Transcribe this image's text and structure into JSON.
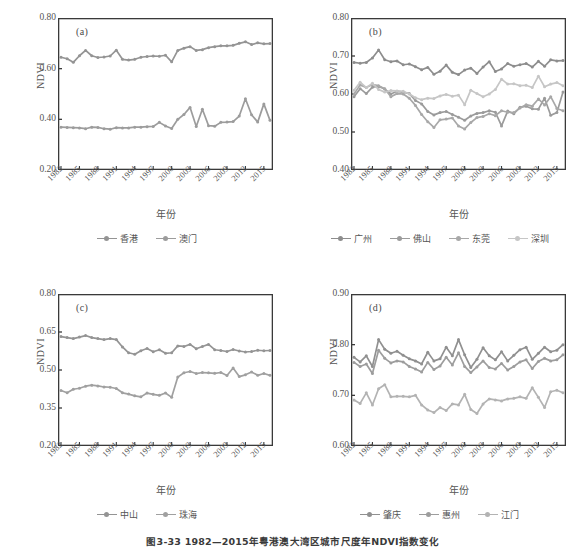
{
  "figure": {
    "caption": "图3-33  1982—2015年粤港澳大湾区城市尺度年NDVI指数变化",
    "axis_label_y": "NDVI",
    "axis_label_x": "年份"
  },
  "colors": {
    "dark_gray": "#8d8d8d",
    "mid_gray": "#a0a0a0",
    "light_gray": "#b9b9b9",
    "pale_gray": "#cfcfcf",
    "axis": "#3a3a3a",
    "text": "#555555"
  },
  "chart_data": [
    {
      "type": "line",
      "title": "(a)",
      "panel": "a",
      "xlabel": "年份",
      "ylabel": "NDVI",
      "ylim": [
        0.2,
        0.8
      ],
      "yticks": [
        "0.20",
        "0.40",
        "0.60",
        "0.80"
      ],
      "ytick_values": [
        0.2,
        0.4,
        0.6,
        0.8
      ],
      "grid": false,
      "legend_position": "bottom",
      "x": [
        1982,
        1983,
        1984,
        1985,
        1986,
        1987,
        1988,
        1989,
        1990,
        1991,
        1992,
        1993,
        1994,
        1995,
        1996,
        1997,
        1998,
        1999,
        2000,
        2001,
        2002,
        2003,
        2004,
        2005,
        2006,
        2007,
        2008,
        2009,
        2010,
        2011,
        2012,
        2013,
        2014,
        2015,
        2016
      ],
      "xticks": [
        "1982",
        "1985",
        "1988",
        "1991",
        "1994",
        "1997",
        "2000",
        "2003",
        "2006",
        "2009",
        "2012",
        "2015"
      ],
      "series": [
        {
          "name": "香港",
          "color": "#949494",
          "values": [
            0.645,
            0.639,
            0.625,
            0.651,
            0.672,
            0.651,
            0.644,
            0.646,
            0.65,
            0.673,
            0.637,
            0.634,
            0.637,
            0.645,
            0.648,
            0.65,
            0.649,
            0.653,
            0.627,
            0.672,
            0.681,
            0.687,
            0.672,
            0.675,
            0.683,
            0.687,
            0.69,
            0.69,
            0.692,
            0.7,
            0.706,
            0.695,
            0.702,
            0.698,
            0.699
          ]
        },
        {
          "name": "澳门",
          "color": "#9c9c9c",
          "values": [
            0.369,
            0.368,
            0.367,
            0.366,
            0.363,
            0.369,
            0.368,
            0.363,
            0.361,
            0.367,
            0.366,
            0.366,
            0.369,
            0.369,
            0.371,
            0.372,
            0.388,
            0.374,
            0.364,
            0.4,
            0.419,
            0.447,
            0.372,
            0.44,
            0.375,
            0.373,
            0.388,
            0.389,
            0.391,
            0.413,
            0.481,
            0.418,
            0.389,
            0.461,
            0.396
          ]
        }
      ]
    },
    {
      "type": "line",
      "title": "(b)",
      "panel": "b",
      "xlabel": "年份",
      "ylabel": "NDVI",
      "ylim": [
        0.4,
        0.8
      ],
      "yticks": [
        "0.40",
        "0.50",
        "0.60",
        "0.70",
        "0.80"
      ],
      "ytick_values": [
        0.4,
        0.5,
        0.6,
        0.7,
        0.8
      ],
      "grid": false,
      "legend_position": "bottom",
      "x": [
        1982,
        1983,
        1984,
        1985,
        1986,
        1987,
        1988,
        1989,
        1990,
        1991,
        1992,
        1993,
        1994,
        1995,
        1996,
        1997,
        1998,
        1999,
        2000,
        2001,
        2002,
        2003,
        2004,
        2005,
        2006,
        2007,
        2008,
        2009,
        2010,
        2011,
        2012,
        2013,
        2014,
        2015,
        2016
      ],
      "xticks": [
        "1982",
        "1985",
        "1988",
        "1991",
        "1994",
        "1997",
        "2000",
        "2003",
        "2006",
        "2009",
        "2012",
        "2015"
      ],
      "series": [
        {
          "name": "广州",
          "color": "#8d8d8d",
          "values": [
            0.683,
            0.681,
            0.683,
            0.695,
            0.716,
            0.69,
            0.685,
            0.687,
            0.677,
            0.679,
            0.672,
            0.664,
            0.67,
            0.652,
            0.66,
            0.676,
            0.657,
            0.651,
            0.663,
            0.668,
            0.654,
            0.671,
            0.685,
            0.659,
            0.666,
            0.68,
            0.673,
            0.677,
            0.68,
            0.671,
            0.686,
            0.673,
            0.69,
            0.687,
            0.688
          ]
        },
        {
          "name": "佛山",
          "color": "#9b9b9b",
          "values": [
            0.593,
            0.614,
            0.601,
            0.618,
            0.62,
            0.613,
            0.6,
            0.607,
            0.605,
            0.601,
            0.583,
            0.574,
            0.554,
            0.545,
            0.551,
            0.554,
            0.546,
            0.539,
            0.531,
            0.542,
            0.549,
            0.551,
            0.556,
            0.552,
            0.516,
            0.555,
            0.548,
            0.565,
            0.568,
            0.561,
            0.56,
            0.589,
            0.544,
            0.551,
            0.605
          ]
        },
        {
          "name": "东莞",
          "color": "#a8a8a8",
          "values": [
            0.6,
            0.624,
            0.617,
            0.625,
            0.622,
            0.614,
            0.593,
            0.601,
            0.6,
            0.589,
            0.57,
            0.546,
            0.527,
            0.512,
            0.532,
            0.534,
            0.537,
            0.516,
            0.508,
            0.525,
            0.538,
            0.541,
            0.548,
            0.543,
            0.556,
            0.552,
            0.551,
            0.563,
            0.572,
            0.568,
            0.587,
            0.571,
            0.593,
            0.562,
            0.556
          ]
        },
        {
          "name": "深圳",
          "color": "#c6c6c6",
          "values": [
            0.61,
            0.631,
            0.617,
            0.628,
            0.612,
            0.605,
            0.609,
            0.608,
            0.607,
            0.6,
            0.59,
            0.585,
            0.589,
            0.588,
            0.595,
            0.599,
            0.594,
            0.597,
            0.572,
            0.61,
            0.601,
            0.593,
            0.6,
            0.612,
            0.639,
            0.626,
            0.627,
            0.622,
            0.623,
            0.617,
            0.647,
            0.619,
            0.626,
            0.63,
            0.622
          ]
        }
      ]
    },
    {
      "type": "line",
      "title": "(c)",
      "panel": "c",
      "xlabel": "年份",
      "ylabel": "NDVI",
      "ylim": [
        0.2,
        0.8
      ],
      "yticks": [
        "0.20",
        "0.35",
        "0.50",
        "0.65",
        "0.80"
      ],
      "ytick_values": [
        0.2,
        0.35,
        0.5,
        0.65,
        0.8
      ],
      "grid": false,
      "legend_position": "bottom",
      "x": [
        1982,
        1983,
        1984,
        1985,
        1986,
        1987,
        1988,
        1989,
        1990,
        1991,
        1992,
        1993,
        1994,
        1995,
        1996,
        1997,
        1998,
        1999,
        2000,
        2001,
        2002,
        2003,
        2004,
        2005,
        2006,
        2007,
        2008,
        2009,
        2010,
        2011,
        2012,
        2013,
        2014,
        2015,
        2016
      ],
      "xticks": [
        "1982",
        "1985",
        "1988",
        "1991",
        "1994",
        "1997",
        "2000",
        "2003",
        "2006",
        "2009",
        "2012",
        "2015"
      ],
      "series": [
        {
          "name": "中山",
          "color": "#949494",
          "values": [
            0.632,
            0.628,
            0.624,
            0.63,
            0.636,
            0.628,
            0.624,
            0.62,
            0.624,
            0.62,
            0.591,
            0.568,
            0.562,
            0.576,
            0.585,
            0.572,
            0.58,
            0.566,
            0.568,
            0.595,
            0.593,
            0.601,
            0.584,
            0.593,
            0.601,
            0.58,
            0.577,
            0.573,
            0.581,
            0.575,
            0.571,
            0.573,
            0.578,
            0.576,
            0.577
          ]
        },
        {
          "name": "珠海",
          "color": "#a0a0a0",
          "values": [
            0.419,
            0.41,
            0.424,
            0.428,
            0.436,
            0.44,
            0.437,
            0.433,
            0.432,
            0.427,
            0.41,
            0.405,
            0.398,
            0.394,
            0.409,
            0.404,
            0.4,
            0.409,
            0.392,
            0.472,
            0.489,
            0.494,
            0.486,
            0.49,
            0.489,
            0.487,
            0.49,
            0.478,
            0.508,
            0.474,
            0.481,
            0.492,
            0.479,
            0.486,
            0.479
          ]
        }
      ]
    },
    {
      "type": "line",
      "title": "(d)",
      "panel": "d",
      "xlabel": "年份",
      "ylabel": "NDVI",
      "ylim": [
        0.6,
        0.9
      ],
      "yticks": [
        "0.60",
        "0.70",
        "0.80",
        "0.90"
      ],
      "ytick_values": [
        0.6,
        0.7,
        0.8,
        0.9
      ],
      "grid": false,
      "legend_position": "bottom",
      "x": [
        1982,
        1983,
        1984,
        1985,
        1986,
        1987,
        1988,
        1989,
        1990,
        1991,
        1992,
        1993,
        1994,
        1995,
        1996,
        1997,
        1998,
        1999,
        2000,
        2001,
        2002,
        2003,
        2004,
        2005,
        2006,
        2007,
        2008,
        2009,
        2010,
        2011,
        2012,
        2013,
        2014,
        2015,
        2016
      ],
      "xticks": [
        "1982",
        "1985",
        "1988",
        "1991",
        "1994",
        "1997",
        "2000",
        "2003",
        "2006",
        "2009",
        "2012",
        "2015"
      ],
      "series": [
        {
          "name": "肇庆",
          "color": "#909090",
          "values": [
            0.775,
            0.766,
            0.778,
            0.757,
            0.81,
            0.791,
            0.783,
            0.787,
            0.779,
            0.772,
            0.768,
            0.762,
            0.785,
            0.768,
            0.772,
            0.795,
            0.778,
            0.81,
            0.78,
            0.755,
            0.771,
            0.794,
            0.778,
            0.77,
            0.786,
            0.768,
            0.779,
            0.79,
            0.795,
            0.771,
            0.783,
            0.795,
            0.786,
            0.789,
            0.8
          ]
        },
        {
          "name": "惠州",
          "color": "#9d9d9d",
          "values": [
            0.765,
            0.757,
            0.762,
            0.743,
            0.789,
            0.773,
            0.764,
            0.768,
            0.766,
            0.757,
            0.752,
            0.746,
            0.765,
            0.751,
            0.758,
            0.775,
            0.76,
            0.784,
            0.757,
            0.745,
            0.756,
            0.768,
            0.755,
            0.752,
            0.763,
            0.75,
            0.757,
            0.766,
            0.77,
            0.753,
            0.767,
            0.773,
            0.768,
            0.77,
            0.78
          ]
        },
        {
          "name": "江门",
          "color": "#b3b3b3",
          "values": [
            0.691,
            0.684,
            0.705,
            0.681,
            0.713,
            0.721,
            0.697,
            0.698,
            0.698,
            0.697,
            0.7,
            0.681,
            0.671,
            0.666,
            0.676,
            0.67,
            0.683,
            0.681,
            0.702,
            0.672,
            0.664,
            0.683,
            0.693,
            0.691,
            0.689,
            0.693,
            0.694,
            0.697,
            0.694,
            0.715,
            0.696,
            0.676,
            0.707,
            0.71,
            0.705
          ]
        }
      ]
    }
  ]
}
